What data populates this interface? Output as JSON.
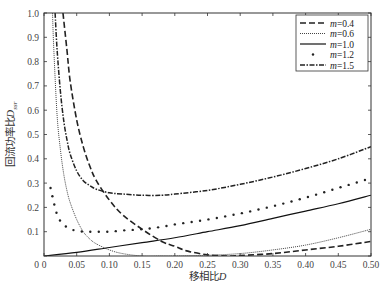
{
  "chart_data": {
    "type": "line",
    "title": "",
    "xlabel": "移相比D",
    "ylabel": "回流功率比D_ssr",
    "ylabel_main": "回流功率比",
    "ylabel_var": "D",
    "ylabel_sub": "ssr",
    "xlabel_main": "移相比",
    "xlabel_var": "D",
    "xlim": [
      0,
      0.5
    ],
    "ylim": [
      0,
      1.0
    ],
    "grid": false,
    "legend_position": "upper right",
    "x_ticks": [
      "0",
      "0.05",
      "0.10",
      "0.15",
      "0.20",
      "0.25",
      "0.30",
      "0.35",
      "0.40",
      "0.45",
      "0.50"
    ],
    "y_ticks": [
      "0",
      "0.1",
      "0.2",
      "0.3",
      "0.4",
      "0.5",
      "0.6",
      "0.7",
      "0.8",
      "0.9",
      "1.0"
    ],
    "series": [
      {
        "name": "m=0.4",
        "style": "dashed",
        "x": [
          0.029,
          0.035,
          0.04,
          0.05,
          0.06,
          0.07,
          0.08,
          0.1,
          0.12,
          0.15,
          0.18,
          0.2,
          0.22,
          0.25,
          0.28,
          0.3,
          0.35,
          0.4,
          0.45,
          0.5
        ],
        "y": [
          1.0,
          0.85,
          0.72,
          0.56,
          0.45,
          0.37,
          0.31,
          0.23,
          0.17,
          0.11,
          0.06,
          0.04,
          0.02,
          0.005,
          0.0,
          0.002,
          0.01,
          0.025,
          0.04,
          0.06
        ]
      },
      {
        "name": "m=0.6",
        "style": "dotted",
        "x": [
          0.013,
          0.015,
          0.02,
          0.025,
          0.03,
          0.035,
          0.04,
          0.05,
          0.06,
          0.07,
          0.08,
          0.1,
          0.12,
          0.15,
          0.18,
          0.2,
          0.25,
          0.3,
          0.35,
          0.4,
          0.45,
          0.5
        ],
        "y": [
          1.0,
          0.85,
          0.58,
          0.44,
          0.34,
          0.27,
          0.22,
          0.15,
          0.1,
          0.07,
          0.05,
          0.025,
          0.01,
          0.0,
          0.0,
          0.0,
          0.003,
          0.01,
          0.025,
          0.045,
          0.075,
          0.11
        ]
      },
      {
        "name": "m=1.0",
        "style": "solid",
        "x": [
          0.0,
          0.05,
          0.1,
          0.15,
          0.2,
          0.25,
          0.3,
          0.35,
          0.4,
          0.45,
          0.5
        ],
        "y": [
          0.0,
          0.015,
          0.035,
          0.055,
          0.075,
          0.1,
          0.125,
          0.155,
          0.185,
          0.215,
          0.25
        ]
      },
      {
        "name": "m=1.2",
        "style": "dots",
        "x": [
          0.01,
          0.02,
          0.03,
          0.04,
          0.05,
          0.06,
          0.08,
          0.1,
          0.12,
          0.15,
          0.18,
          0.2,
          0.25,
          0.3,
          0.35,
          0.4,
          0.45,
          0.5
        ],
        "y": [
          0.28,
          0.17,
          0.13,
          0.11,
          0.105,
          0.1,
          0.1,
          0.1,
          0.105,
          0.11,
          0.12,
          0.13,
          0.15,
          0.175,
          0.205,
          0.24,
          0.28,
          0.32
        ]
      },
      {
        "name": "m=1.5",
        "style": "dashdot",
        "x": [
          0.017,
          0.02,
          0.025,
          0.03,
          0.035,
          0.04,
          0.05,
          0.06,
          0.07,
          0.08,
          0.1,
          0.12,
          0.15,
          0.18,
          0.2,
          0.25,
          0.3,
          0.35,
          0.4,
          0.45,
          0.5
        ],
        "y": [
          1.0,
          0.85,
          0.68,
          0.56,
          0.48,
          0.42,
          0.35,
          0.31,
          0.29,
          0.275,
          0.26,
          0.255,
          0.25,
          0.25,
          0.255,
          0.27,
          0.295,
          0.325,
          0.36,
          0.4,
          0.45
        ]
      }
    ]
  }
}
